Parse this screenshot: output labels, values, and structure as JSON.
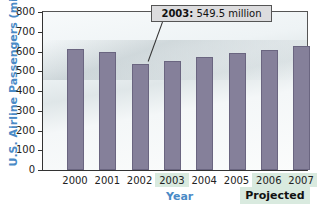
{
  "chart_data": {
    "type": "bar",
    "title": "",
    "xlabel": "Year",
    "ylabel": "U.S. Airline Passengers (millions)",
    "categories": [
      "2000",
      "2001",
      "2002",
      "2003",
      "2004",
      "2005",
      "2006",
      "2007"
    ],
    "values": [
      615,
      600,
      535,
      549.5,
      570,
      590,
      610,
      630
    ],
    "ylim": [
      0,
      800
    ],
    "yticks": [
      "0",
      "100",
      "200",
      "300",
      "400",
      "500",
      "600",
      "700",
      "800"
    ],
    "grid": false,
    "annotations": [
      {
        "target": "2003",
        "bold": "2003:",
        "text": " 549.5 million"
      },
      {
        "target": "2006-2007",
        "text": "Projected"
      }
    ],
    "bar_color": "#85809a"
  }
}
